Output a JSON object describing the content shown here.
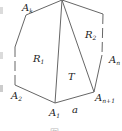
{
  "figure": {
    "vertices": {
      "A1": {
        "label": "A",
        "sub": "1"
      },
      "A2": {
        "label": "A",
        "sub": "2"
      },
      "Ak": {
        "label": "A",
        "sub": "k"
      },
      "An": {
        "label": "A",
        "sub": "n"
      },
      "An1": {
        "label": "A",
        "sub": "n+1"
      }
    },
    "regions": {
      "R1": {
        "label": "R",
        "sub": "1"
      },
      "R2": {
        "label": "R",
        "sub": "2"
      },
      "T": {
        "label": "T"
      }
    },
    "edge_label": "a",
    "caption": "图"
  }
}
